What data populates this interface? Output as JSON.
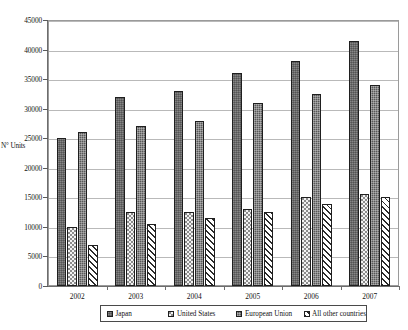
{
  "chart_data": {
    "type": "bar",
    "title": "",
    "xlabel": "",
    "ylabel": "N° Units",
    "ylim": [
      0,
      45000
    ],
    "ytick_step": 5000,
    "yticks": [
      "0",
      "5000",
      "10000",
      "15000",
      "20000",
      "25000",
      "30000",
      "35000",
      "40000",
      "45000"
    ],
    "grid": true,
    "legend_position": "bottom",
    "categories": [
      "2002",
      "2003",
      "2004",
      "2005",
      "2006",
      "2007"
    ],
    "series": [
      {
        "name": "Japan",
        "pattern": "solid-dark-gray",
        "values": [
          25000,
          32000,
          33000,
          36000,
          38000,
          41500
        ]
      },
      {
        "name": "United States",
        "pattern": "light-dotted",
        "values": [
          10000,
          12500,
          12500,
          13000,
          15000,
          15500
        ]
      },
      {
        "name": "European Union",
        "pattern": "dark-checkered",
        "values": [
          26000,
          27000,
          28000,
          31000,
          32500,
          34000
        ]
      },
      {
        "name": "All other countries",
        "pattern": "diagonal-hatch",
        "values": [
          7000,
          10500,
          11500,
          12500,
          13800,
          15000
        ]
      }
    ]
  },
  "legend": {
    "items": [
      {
        "label": "Japan"
      },
      {
        "label": "United States"
      },
      {
        "label": "European Union"
      },
      {
        "label": "All other countries"
      }
    ]
  }
}
